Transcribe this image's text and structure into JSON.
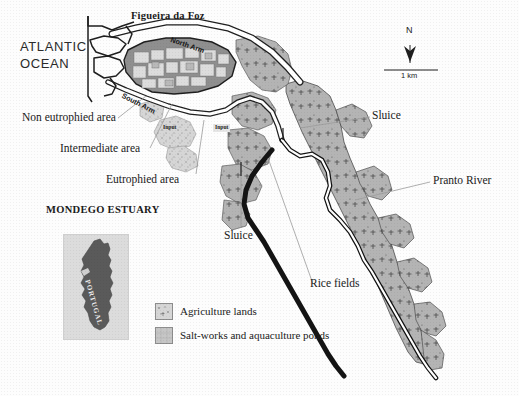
{
  "figure": {
    "kind": "scanned-map-figure",
    "region": "Mondego Estuary, Portugal"
  },
  "titles": {
    "city": "Figueira da Foz",
    "ocean_line1": "ATLANTIC",
    "ocean_line2": "OCEAN",
    "inset_title": "MONDEGO ESTUARY",
    "inset_country": "PORTUGAL"
  },
  "water_labels": {
    "north_arm": "North Arm",
    "south_arm": "South Arm",
    "pranto_river": "Pranto River"
  },
  "annotations": {
    "non_eutrophied": "Non eutrophied area",
    "intermediate": "Intermediate area",
    "eutrophied": "Eutrophied area",
    "sluice_north": "Sluice",
    "sluice_south": "Sluice",
    "rice_fields": "Rice fields",
    "input_left": "Input",
    "input_right": "Input"
  },
  "compass": {
    "north_letter": "N",
    "scale_label": "1 km"
  },
  "legend": {
    "items": [
      {
        "label": "Agriculture lands",
        "swatch": "agriculture-swatch",
        "color": "#d2d2d2"
      },
      {
        "label": "Salt-works and aquaculture ponds",
        "swatch": "saltworks-swatch",
        "color": "#c4c4c4"
      }
    ]
  },
  "colors": {
    "paper": "#fdfdfd",
    "ink": "#1a1a1a",
    "land_light": "#d8d8d8",
    "land_mid": "#b9b9b9",
    "land_dark": "#8f8f8f",
    "marsh": "#a8a8a8",
    "inset_land": "#5a5a5a",
    "inset_sea": "#dcdcdc"
  }
}
